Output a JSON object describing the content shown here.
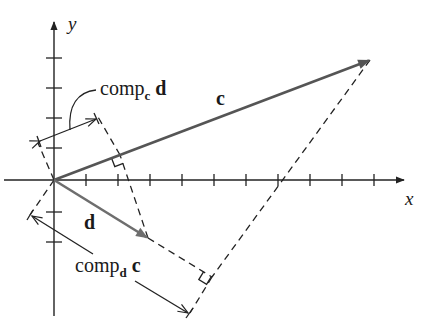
{
  "figure": {
    "type": "vector-projection-diagram",
    "axes": {
      "x_label": "x",
      "y_label": "y",
      "origin_px": [
        54,
        180
      ],
      "tick_spacing_px": 32,
      "x_ticks_px": [
        86,
        118,
        150,
        182,
        214,
        246,
        278,
        310,
        342,
        374
      ],
      "y_ticks_px": [
        58,
        88,
        118,
        148,
        212,
        242
      ]
    },
    "vectors": [
      {
        "name": "c",
        "label": "c",
        "from": [
          54,
          180
        ],
        "to": [
          370,
          60
        ],
        "color": "#555555"
      },
      {
        "name": "d",
        "label": "d",
        "from": [
          54,
          180
        ],
        "to": [
          148,
          238
        ],
        "color": "#6e6e6e"
      }
    ],
    "annotations": {
      "comp_c_d": {
        "main": "comp",
        "subscript": "c",
        "argument": "d"
      },
      "comp_d_c": {
        "main": "comp",
        "subscript": "d",
        "argument": "c"
      }
    },
    "colors": {
      "axis": "#222222",
      "vector_c": "#555555",
      "vector_d": "#6e6e6e",
      "dashed": "#222222",
      "text": "#1a1a1a"
    }
  }
}
